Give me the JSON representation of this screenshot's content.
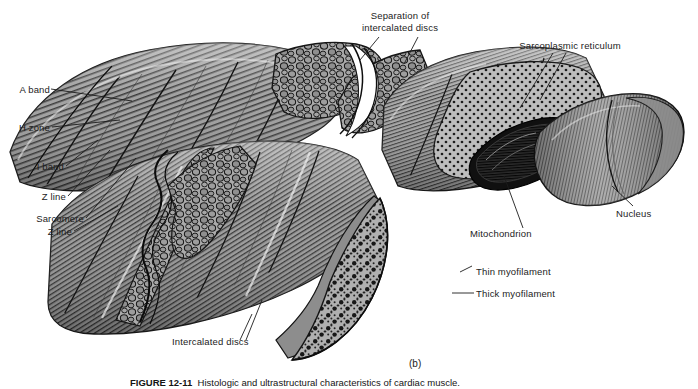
{
  "figure": {
    "panel_label": "(b)",
    "caption_prefix": "FIGURE 12-11",
    "caption_text": "Histologic and ultrastructural characteristics of cardiac muscle.",
    "caption_full": "FIGURE 12-11  Histologic and ultrastructural characteristics of cardiac muscle.",
    "style": "grayscale line-and-tone anatomical illustration"
  },
  "labels": {
    "a_band": "A band",
    "h_zone": "H zone",
    "i_band": "I band",
    "z_line_upper": "Z line",
    "sarcomere": "Sarcomere",
    "z_line_lower": "Z line",
    "separation_line1": "Separation of",
    "separation_line2": "intercalated discs",
    "sarcoplasmic_reticulum": "Sarcoplasmic reticulum",
    "nucleus": "Nucleus",
    "mitochondrion": "Mitochondrion",
    "thin_myofilament": "Thin myofilament",
    "thick_myofilament": "Thick myofilament",
    "intercalated_discs": "Intercalated discs"
  },
  "colors": {
    "background": "#ffffff",
    "ink": "#1c1c1c",
    "fiber_body": "#9a9a9a",
    "fiber_body_light": "#b4b4b4",
    "cross_section_face": "#a9a9a9",
    "cross_section_face_light": "#c2c2c2",
    "shadow_dark": "#3a3a3a",
    "striation": "#2b2b2b",
    "highlight": "#f2f2f2"
  },
  "structures": [
    {
      "name": "upper-left-fiber",
      "type": "striated cylindrical cardiac muscle fiber, longitudinal view"
    },
    {
      "name": "upper-right-fiber",
      "type": "striated cardiac muscle fiber with cutaway showing organelles"
    },
    {
      "name": "lower-center-fiber",
      "type": "striated cardiac muscle fiber with wedge cross-section face"
    },
    {
      "name": "interdigitation-zone",
      "type": "separated intercalated disc showing finger-like projections"
    },
    {
      "name": "nucleus-body",
      "type": "ovoid centrally placed nucleus"
    },
    {
      "name": "mitochondrion-body",
      "type": "elongated mitochondrion with cristae"
    }
  ]
}
